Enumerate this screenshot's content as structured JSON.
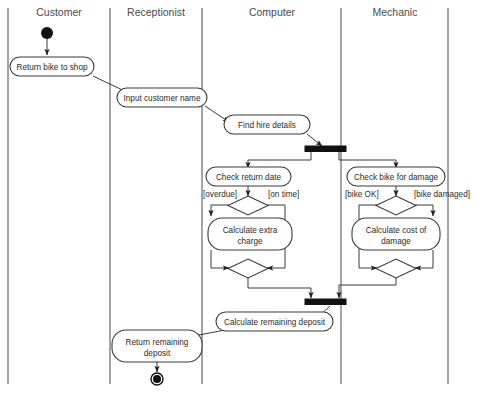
{
  "diagram": {
    "type": "uml-activity-diagram",
    "lanes": [
      {
        "id": "customer",
        "label": "Customer"
      },
      {
        "id": "receptionist",
        "label": "Receptionist"
      },
      {
        "id": "computer",
        "label": "Computer"
      },
      {
        "id": "mechanic",
        "label": "Mechanic"
      }
    ],
    "nodes": {
      "start": {
        "kind": "initial-node",
        "lane": "customer"
      },
      "return_bike": {
        "kind": "action",
        "lane": "customer",
        "label": "Return bike to shop"
      },
      "input_name": {
        "kind": "action",
        "lane": "receptionist",
        "label": "Input customer name"
      },
      "find_hire": {
        "kind": "action",
        "lane": "computer",
        "label": "Find hire details"
      },
      "fork": {
        "kind": "fork-bar",
        "lane": "computer"
      },
      "check_return": {
        "kind": "action",
        "lane": "computer",
        "label": "Check return date"
      },
      "check_damage": {
        "kind": "action",
        "lane": "mechanic",
        "label": "Check bike for damage"
      },
      "decision_left": {
        "kind": "decision",
        "lane": "computer"
      },
      "decision_right": {
        "kind": "decision",
        "lane": "mechanic"
      },
      "calc_extra": {
        "kind": "action",
        "lane": "computer",
        "label": "Calculate extra charge",
        "line1": "Calculate extra",
        "line2": "charge"
      },
      "calc_damage": {
        "kind": "action",
        "lane": "mechanic",
        "label": "Calculate cost of damage",
        "line1": "Calculate cost of",
        "line2": "damage"
      },
      "merge_left": {
        "kind": "merge",
        "lane": "computer"
      },
      "merge_right": {
        "kind": "merge",
        "lane": "mechanic"
      },
      "join": {
        "kind": "join-bar",
        "lane": "computer"
      },
      "calc_deposit": {
        "kind": "action",
        "lane": "computer",
        "label": "Calculate remaining deposit"
      },
      "return_deposit": {
        "kind": "action",
        "lane": "customer",
        "label": "Return remaining deposit",
        "line1": "Return remaining",
        "line2": "deposit"
      },
      "end": {
        "kind": "final-node",
        "lane": "customer"
      }
    },
    "guards": {
      "overdue": "[overdue]",
      "on_time": "[on time]",
      "bike_ok": "[bike OK]",
      "bike_damaged": "[bike damaged]"
    },
    "colors": {
      "line": "#3a3a3a",
      "lane_divider": "#5a5a5a",
      "fill": "#ffffff",
      "node_solid": "#111111",
      "label_text": "#4a4a4a"
    }
  }
}
